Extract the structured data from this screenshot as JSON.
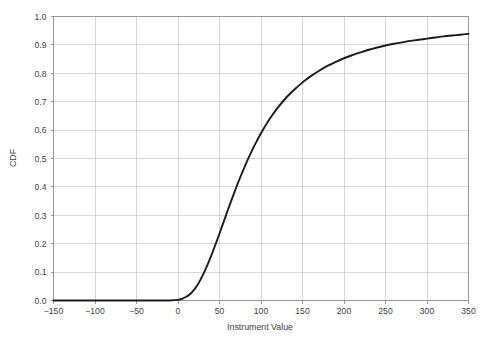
{
  "chart_data": {
    "type": "line",
    "title": "",
    "xlabel": "Instrument Value",
    "ylabel": "CDF",
    "xlim": [
      -150,
      350
    ],
    "ylim": [
      0.0,
      1.0
    ],
    "grid": true,
    "legend_position": "none",
    "xticks": [
      -150,
      -100,
      -50,
      0,
      50,
      100,
      150,
      200,
      250,
      300,
      350
    ],
    "xtick_labels": [
      "−150",
      "−100",
      "−50",
      "0",
      "50",
      "100",
      "150",
      "200",
      "250",
      "300",
      "350"
    ],
    "yticks": [
      0.0,
      0.1,
      0.2,
      0.3,
      0.4,
      0.5,
      0.6,
      0.7,
      0.8,
      0.9,
      1.0
    ],
    "ytick_labels": [
      "0.0",
      "0.1",
      "0.2",
      "0.3",
      "0.4",
      "0.5",
      "0.6",
      "0.7",
      "0.8",
      "0.9",
      "1.0"
    ],
    "series": [
      {
        "name": "CDF",
        "color": "#1b1b1b",
        "x": [
          -150,
          -125,
          -100,
          -75,
          -50,
          -25,
          -10,
          0,
          5,
          10,
          15,
          20,
          25,
          30,
          35,
          40,
          45,
          50,
          55,
          60,
          65,
          70,
          75,
          80,
          85,
          90,
          95,
          100,
          110,
          120,
          130,
          140,
          150,
          160,
          170,
          180,
          190,
          200,
          210,
          220,
          230,
          240,
          250,
          260,
          270,
          280,
          290,
          300,
          310,
          320,
          330,
          340,
          350
        ],
        "values": [
          0.0,
          0.0,
          0.0,
          0.0,
          0.0,
          0.0,
          0.0,
          0.002,
          0.006,
          0.013,
          0.024,
          0.04,
          0.062,
          0.09,
          0.122,
          0.157,
          0.196,
          0.236,
          0.277,
          0.318,
          0.358,
          0.397,
          0.434,
          0.469,
          0.502,
          0.533,
          0.562,
          0.589,
          0.637,
          0.678,
          0.713,
          0.742,
          0.768,
          0.79,
          0.809,
          0.826,
          0.84,
          0.853,
          0.864,
          0.874,
          0.883,
          0.891,
          0.898,
          0.904,
          0.909,
          0.914,
          0.918,
          0.922,
          0.926,
          0.93,
          0.933,
          0.936,
          0.939
        ]
      }
    ],
    "annotations": []
  },
  "axes": {
    "y_axis_title": "CDF",
    "x_axis_title": "Instrument Value"
  }
}
